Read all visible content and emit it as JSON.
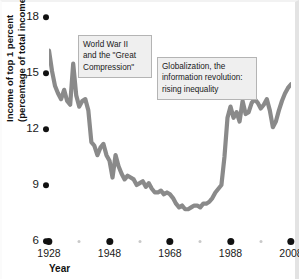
{
  "figure": {
    "title": "",
    "x_title": "Year",
    "y_title_line1": "Income of top 1 percent",
    "y_title_line2": "(percentage of total income)"
  },
  "annotations": [
    {
      "id": "ww2",
      "lines": [
        "World War II",
        "and the \"Great",
        "Compression\""
      ]
    },
    {
      "id": "globalization",
      "lines": [
        "Globalization, the",
        "information revolution:",
        "rising inequality"
      ]
    }
  ],
  "colors": {
    "line": "#8a8a8a",
    "tick_dot": "#111111",
    "minor_dot": "#c9c9c9",
    "callout_bg": "#efefef",
    "callout_border": "#b4b4b4",
    "text": "#1a1a1a",
    "background": "#ffffff"
  },
  "chart_data": {
    "type": "line",
    "title": "",
    "xlabel": "Year",
    "ylabel": "Income of top 1 percent (percentage of total income)",
    "xlim": [
      1928,
      2008
    ],
    "ylim": [
      6,
      18
    ],
    "grid": false,
    "legend": "none",
    "y_ticks": [
      6,
      9,
      12,
      15,
      18
    ],
    "x_ticks_major": [
      1928,
      1948,
      1968,
      1988,
      2008
    ],
    "x_ticks_minor": [
      1938,
      1958,
      1978,
      1998
    ],
    "series": [
      {
        "name": "Income share of top 1 percent",
        "x": [
          1928,
          1929,
          1930,
          1931,
          1932,
          1933,
          1934,
          1935,
          1936,
          1937,
          1938,
          1939,
          1940,
          1941,
          1942,
          1943,
          1944,
          1945,
          1946,
          1947,
          1948,
          1949,
          1950,
          1951,
          1952,
          1953,
          1954,
          1955,
          1956,
          1957,
          1958,
          1959,
          1960,
          1961,
          1962,
          1963,
          1964,
          1965,
          1966,
          1967,
          1968,
          1969,
          1970,
          1971,
          1972,
          1973,
          1974,
          1975,
          1976,
          1977,
          1978,
          1979,
          1980,
          1981,
          1982,
          1983,
          1984,
          1985,
          1986,
          1987,
          1988,
          1989,
          1990,
          1991,
          1992,
          1993,
          1994,
          1995,
          1996,
          1997,
          1998,
          1999,
          2000,
          2001,
          2002,
          2003,
          2004,
          2005,
          2006,
          2007,
          2008
        ],
        "y": [
          16.2,
          15.1,
          14.3,
          13.9,
          13.6,
          14.1,
          13.5,
          13.3,
          15.5,
          13.8,
          13.2,
          13.5,
          13.6,
          13.0,
          11.3,
          11.1,
          10.6,
          11.0,
          11.2,
          10.6,
          10.3,
          9.4,
          10.6,
          10.0,
          9.6,
          9.3,
          9.5,
          9.4,
          9.3,
          9.0,
          9.1,
          9.2,
          8.9,
          9.1,
          8.8,
          8.6,
          8.6,
          8.7,
          8.5,
          8.6,
          8.5,
          8.3,
          8.0,
          7.8,
          7.9,
          7.7,
          7.7,
          7.8,
          7.9,
          7.9,
          7.8,
          8.0,
          8.0,
          8.1,
          8.3,
          8.6,
          8.8,
          9.0,
          10.5,
          12.6,
          13.2,
          12.6,
          12.9,
          12.4,
          13.5,
          12.8,
          12.9,
          13.4,
          14.1,
          14.6,
          15.0,
          15.3,
          16.5,
          15.2,
          14.3,
          14.5,
          15.6,
          16.4,
          16.8,
          17.4,
          17.9
        ],
        "y_plot": [
          16.2,
          15.1,
          14.3,
          13.9,
          13.6,
          14.1,
          13.5,
          13.3,
          15.5,
          13.8,
          13.2,
          13.5,
          13.6,
          13.0,
          11.3,
          11.1,
          10.6,
          11.0,
          11.2,
          10.6,
          10.3,
          9.4,
          10.6,
          10.0,
          9.6,
          9.3,
          9.5,
          9.4,
          9.3,
          9.0,
          9.1,
          9.2,
          8.9,
          9.1,
          8.8,
          8.6,
          8.6,
          8.7,
          8.5,
          8.6,
          8.5,
          8.3,
          8.0,
          7.8,
          7.9,
          7.7,
          7.7,
          7.8,
          7.9,
          7.9,
          7.8,
          8.0,
          8.0,
          8.1,
          8.3,
          8.6,
          8.8,
          9.0,
          10.5,
          12.6,
          13.2,
          12.6,
          12.9,
          12.4,
          13.5,
          12.8,
          12.9,
          13.4,
          13.6,
          13.4,
          13.1,
          13.3,
          13.6,
          13.0,
          12.1,
          12.4,
          13.0,
          13.5,
          13.9,
          14.2,
          14.4
        ]
      }
    ]
  }
}
